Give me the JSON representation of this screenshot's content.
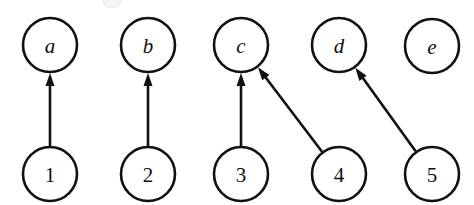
{
  "figure": {
    "kind": "directed-bipartite-graph",
    "background_color": "#ffffff",
    "stroke_color": "#111111",
    "width": 474,
    "height": 205,
    "node_radius": 27,
    "node_stroke_width": 2.6
  },
  "chart_data": {
    "type": "diagram",
    "title": "",
    "xlabel": "",
    "ylabel": "",
    "layout": "two-rows-bipartite",
    "top_row_label_style": "italic-serif-letters",
    "bottom_row_label_style": "upright-serif-digits",
    "nodes": [
      {
        "id": "a",
        "label": "a",
        "row": "top",
        "cx": 50,
        "cy": 45,
        "r": 27
      },
      {
        "id": "b",
        "label": "b",
        "row": "top",
        "cx": 148,
        "cy": 45,
        "r": 27
      },
      {
        "id": "c",
        "label": "c",
        "row": "top",
        "cx": 241,
        "cy": 45,
        "r": 27
      },
      {
        "id": "d",
        "label": "d",
        "row": "top",
        "cx": 339,
        "cy": 45,
        "r": 27
      },
      {
        "id": "e",
        "label": "e",
        "row": "top",
        "cx": 432,
        "cy": 46,
        "r": 27
      },
      {
        "id": "1",
        "label": "1",
        "row": "bottom",
        "cx": 50,
        "cy": 174,
        "r": 27
      },
      {
        "id": "2",
        "label": "2",
        "row": "bottom",
        "cx": 148,
        "cy": 174,
        "r": 27
      },
      {
        "id": "3",
        "label": "3",
        "row": "bottom",
        "cx": 241,
        "cy": 174,
        "r": 27
      },
      {
        "id": "4",
        "label": "4",
        "row": "bottom",
        "cx": 339,
        "cy": 174,
        "r": 27
      },
      {
        "id": "5",
        "label": "5",
        "row": "bottom",
        "cx": 432,
        "cy": 174,
        "r": 27
      }
    ],
    "edges": [
      {
        "from": "1",
        "to": "a",
        "directed": true,
        "arrow_at": "a"
      },
      {
        "from": "2",
        "to": "b",
        "directed": true,
        "arrow_at": "b"
      },
      {
        "from": "3",
        "to": "c",
        "directed": true,
        "arrow_at": "c"
      },
      {
        "from": "4",
        "to": "c",
        "directed": true,
        "arrow_at": "c"
      },
      {
        "from": "5",
        "to": "d",
        "directed": true,
        "arrow_at": "d"
      }
    ],
    "unmatched_nodes": [
      "e"
    ]
  }
}
